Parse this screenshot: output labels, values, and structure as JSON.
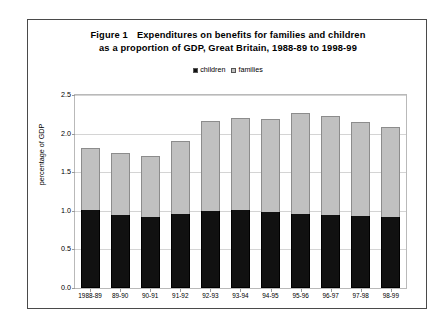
{
  "figure": {
    "number": "Figure 1",
    "title_line1": "Expenditures on benefits for families and children",
    "title_line2": "as a proportion of GDP, Great Britain, 1988-89 to 1998-99"
  },
  "legend": {
    "position": "top-center",
    "entries": [
      {
        "label": "children",
        "color": "#111111",
        "icon": "square-swatch-icon"
      },
      {
        "label": "families",
        "color": "#c0c0c0",
        "icon": "square-swatch-icon"
      }
    ]
  },
  "chart_data": {
    "type": "bar",
    "stacked": true,
    "xlabel": "",
    "ylabel": "percentage of GDP",
    "ylim": [
      0.0,
      2.5
    ],
    "ytick_labels": [
      "2.5",
      "2.0",
      "1.5",
      "1.0",
      "0.5",
      "0.0"
    ],
    "ytick_values": [
      2.5,
      2.0,
      1.5,
      1.0,
      0.5,
      0.0
    ],
    "grid": true,
    "legend_position": "top-center",
    "categories": [
      "1988-89",
      "89-90",
      "90-91",
      "91-92",
      "92-93",
      "93-94",
      "94-95",
      "95-96",
      "96-97",
      "97-98",
      "98-99"
    ],
    "series": [
      {
        "name": "children",
        "color": "#111111",
        "values": [
          1.01,
          0.95,
          0.92,
          0.96,
          1.0,
          1.01,
          0.99,
          0.96,
          0.95,
          0.93,
          0.92
        ]
      },
      {
        "name": "families",
        "color": "#c0c0c0",
        "values": [
          0.81,
          0.8,
          0.79,
          0.95,
          1.16,
          1.19,
          1.2,
          1.31,
          1.28,
          1.22,
          1.17
        ]
      }
    ],
    "totals": [
      1.82,
      1.75,
      1.71,
      1.91,
      2.16,
      2.2,
      2.19,
      2.27,
      2.23,
      2.15,
      2.09
    ]
  }
}
